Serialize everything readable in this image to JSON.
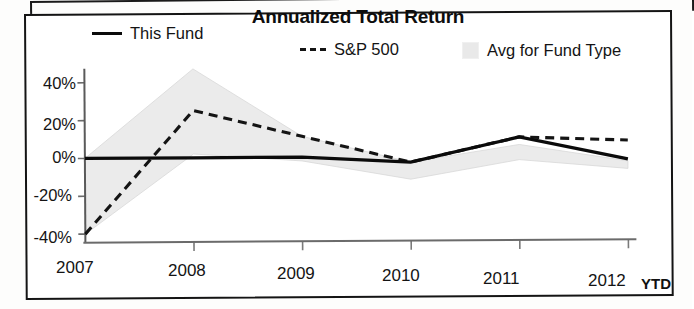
{
  "chart_data": {
    "type": "line",
    "title": "Annualized Total Return",
    "xlabel": "",
    "ylabel": "",
    "x": [
      "2007",
      "2008",
      "2009",
      "2010",
      "2011",
      "2012 YTD"
    ],
    "xtick_labels": [
      "2007",
      "2008",
      "2009",
      "2010",
      "2011",
      "2012"
    ],
    "ytick_labels": [
      "40%",
      "20%",
      "0%",
      "-20%",
      "-40%"
    ],
    "ytick_values": [
      40,
      20,
      0,
      -20,
      -40
    ],
    "ylim": [
      -45,
      50
    ],
    "grid": false,
    "legend_position": "top",
    "series": [
      {
        "name": "This Fund",
        "style": "solid",
        "color": "#0b0b0b",
        "values": [
          0,
          0,
          0,
          -3,
          10,
          -2
        ]
      },
      {
        "name": "S&P 500",
        "style": "dashed",
        "color": "#141414",
        "values": [
          -40,
          25,
          11,
          -3,
          10,
          8
        ]
      },
      {
        "name": "Avg for Fund Type",
        "style": "band",
        "color": "#e9e9e9",
        "upper": [
          0,
          47,
          11,
          -3,
          6,
          -3
        ],
        "lower": [
          -40,
          2,
          -2,
          -12,
          -2,
          -7
        ]
      }
    ],
    "annotations": [
      {
        "text": "YTD",
        "x": "2012"
      }
    ]
  },
  "legend": {
    "items": [
      {
        "label": "This Fund",
        "swatch": "solid-line-swatch"
      },
      {
        "label": "S&P 500",
        "swatch": "dashed-line-swatch"
      },
      {
        "label": "Avg for Fund Type",
        "swatch": "shaded-band-swatch"
      }
    ]
  },
  "axis": {
    "y": {
      "t0": "40%",
      "t1": "20%",
      "t2": "0%",
      "t3": "-20%",
      "t4": "-40%"
    },
    "x": {
      "t0": "2007",
      "t1": "2008",
      "t2": "2009",
      "t3": "2010",
      "t4": "2011",
      "t5": "2012",
      "ytd": "YTD"
    }
  }
}
